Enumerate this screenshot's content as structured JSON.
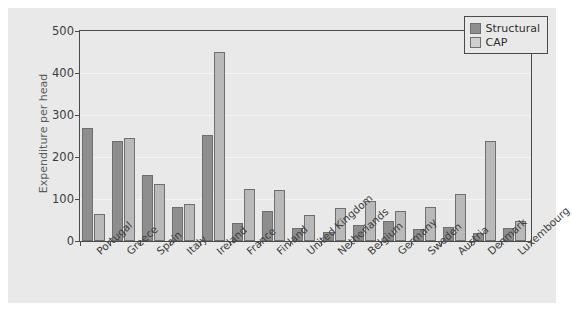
{
  "chart_data": {
    "type": "bar",
    "title": "",
    "xlabel": "",
    "ylabel": "Expenditure per head",
    "ylim": [
      0,
      500
    ],
    "yticks": [
      0,
      100,
      200,
      300,
      400,
      500
    ],
    "grid": true,
    "legend_position": "top-right",
    "categories": [
      "Portugal",
      "Greece",
      "Spain",
      "Italy",
      "Ireland",
      "France",
      "Finland",
      "United Kingdom",
      "Netherlands",
      "Belgium",
      "Germany",
      "Sweden",
      "Austria",
      "Denmark",
      "Luxembourg"
    ],
    "series": [
      {
        "name": "Structural",
        "color": "#8e8e8e",
        "values": [
          268,
          238,
          158,
          80,
          252,
          42,
          72,
          32,
          22,
          38,
          48,
          28,
          33,
          20,
          30
        ]
      },
      {
        "name": "CAP",
        "color": "#b9b9b9",
        "values": [
          65,
          245,
          135,
          88,
          450,
          125,
          122,
          62,
          78,
          95,
          72,
          80,
          112,
          238,
          48
        ]
      }
    ]
  },
  "legend": {
    "items": [
      {
        "label": "Structural"
      },
      {
        "label": "CAP"
      }
    ]
  }
}
